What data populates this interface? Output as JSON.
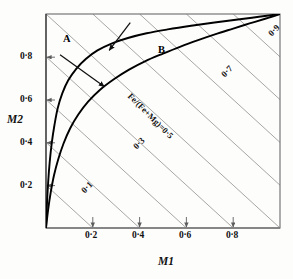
{
  "figure": {
    "background_color": "#fdfdfc",
    "frame_color": "#6b6b6b",
    "curve_color": "#000000",
    "contour_color": "#8a8a8a",
    "arrow_color": "#111111"
  },
  "axes": {
    "x": {
      "title": "M1",
      "min": 0,
      "max": 1,
      "ticks": [
        0.2,
        0.4,
        0.6,
        0.8
      ],
      "tick_labels": [
        "0·2",
        "0·4",
        "0·6",
        "0·8"
      ]
    },
    "y": {
      "title": "M2",
      "min": 0,
      "max": 1,
      "ticks": [
        0.2,
        0.4,
        0.6,
        0.8
      ],
      "tick_labels": [
        "0·2",
        "0·4",
        "0·6",
        "0·8"
      ]
    }
  },
  "curve_labels": [
    {
      "text": "A",
      "x": 0.07,
      "y": 0.9
    },
    {
      "text": "B",
      "x": 0.5,
      "y": 0.86
    }
  ],
  "annotation": {
    "text": "Fe/(Fe+Mg)=0·5",
    "rotation_deg": 45
  },
  "contour_labels": [
    {
      "text": "0·1",
      "value": 0.1
    },
    {
      "text": "0·3",
      "value": 0.3
    },
    {
      "text": "0·7",
      "value": 0.7
    },
    {
      "text": "0·9",
      "value": 0.9
    }
  ],
  "chart_data": {
    "type": "line",
    "title": "",
    "xlabel": "M1",
    "ylabel": "M2",
    "xlim": [
      0,
      1
    ],
    "ylim": [
      0,
      1
    ],
    "grid": false,
    "legend_position": "inline-labels",
    "annotations": [
      {
        "text": "A",
        "x": 0.07,
        "y": 0.9,
        "kind": "curve-label"
      },
      {
        "text": "B",
        "x": 0.5,
        "y": 0.86,
        "kind": "curve-label"
      },
      {
        "text": "Fe/(Fe+Mg)=0·5",
        "x": 0.42,
        "y": 0.47,
        "kind": "contour-annotation",
        "rotation_deg": 45
      }
    ],
    "arrows": [
      {
        "from_x": 0.06,
        "from_y": 0.81,
        "to_x": 0.25,
        "to_y": 0.66,
        "target": "curve-B"
      },
      {
        "from_x": 0.36,
        "from_y": 0.96,
        "to_x": 0.27,
        "to_y": 0.83,
        "target": "curve-A"
      }
    ],
    "series": [
      {
        "name": "A",
        "type": "line",
        "color": "#000000",
        "x": [
          0.0,
          0.004,
          0.009,
          0.016,
          0.025,
          0.036,
          0.05,
          0.07,
          0.095,
          0.13,
          0.17,
          0.22,
          0.28,
          0.35,
          0.43,
          0.52,
          0.62,
          0.72,
          0.82,
          0.91,
          1.0
        ],
        "y": [
          0.0,
          0.11,
          0.21,
          0.31,
          0.4,
          0.48,
          0.56,
          0.63,
          0.69,
          0.745,
          0.79,
          0.83,
          0.862,
          0.888,
          0.91,
          0.928,
          0.945,
          0.96,
          0.974,
          0.987,
          1.0
        ]
      },
      {
        "name": "B",
        "type": "line",
        "color": "#000000",
        "x": [
          0.0,
          0.009,
          0.02,
          0.034,
          0.052,
          0.075,
          0.103,
          0.138,
          0.18,
          0.23,
          0.29,
          0.355,
          0.425,
          0.5,
          0.575,
          0.65,
          0.725,
          0.8,
          0.87,
          0.94,
          1.0
        ],
        "y": [
          0.0,
          0.085,
          0.165,
          0.245,
          0.32,
          0.395,
          0.465,
          0.53,
          0.59,
          0.645,
          0.695,
          0.74,
          0.78,
          0.815,
          0.848,
          0.878,
          0.906,
          0.932,
          0.956,
          0.979,
          1.0
        ]
      }
    ],
    "contours": {
      "name": "Fe/(Fe+Mg)",
      "description": "Family of straight anti-diagonal lines x + y = 2c, labelled by ratio value c",
      "values": [
        0.1,
        0.2,
        0.3,
        0.4,
        0.5,
        0.6,
        0.7,
        0.8,
        0.9
      ],
      "labelled_values": [
        0.1,
        0.3,
        0.5,
        0.7,
        0.9
      ],
      "color": "#8a8a8a"
    }
  }
}
